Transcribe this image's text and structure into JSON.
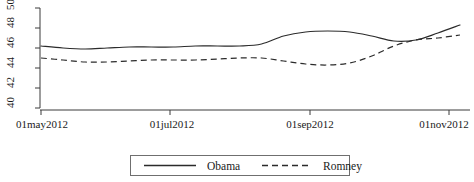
{
  "chart_data": {
    "type": "line",
    "title": "",
    "xlabel": "",
    "ylabel": "",
    "grid": false,
    "legend_position": "bottom-center",
    "ylim": [
      40,
      50
    ],
    "yticks": [
      40,
      42,
      44,
      46,
      48,
      50
    ],
    "ytick_labels": [
      "40",
      "42",
      "44",
      "46",
      "48",
      "50"
    ],
    "xticks": [
      "01may2012",
      "01jul2012",
      "01sep2012",
      "01nov2012"
    ],
    "xtick_labels": [
      "01may2012",
      "01jul2012",
      "01sep2012",
      "01nov2012"
    ],
    "xlim": [
      "01may2012",
      "01nov2012"
    ],
    "series": [
      {
        "name": "Obama",
        "style": "solid",
        "color": "#2b2b2b",
        "x": [
          "01may2012",
          "08may2012",
          "15may2012",
          "01jun2012",
          "15jun2012",
          "01jul2012",
          "15jul2012",
          "01aug2012",
          "15aug2012",
          "25aug2012",
          "01sep2012",
          "08sep2012",
          "15sep2012",
          "22sep2012",
          "29sep2012",
          "06oct2012",
          "13oct2012",
          "20oct2012",
          "27oct2012",
          "01nov2012"
        ],
        "values": [
          46.2,
          46.0,
          45.9,
          46.0,
          46.1,
          46.1,
          46.1,
          46.2,
          46.2,
          46.2,
          46.4,
          47.2,
          47.6,
          47.7,
          47.6,
          47.2,
          46.7,
          46.8,
          47.5,
          48.3
        ]
      },
      {
        "name": "Romney",
        "style": "dashed",
        "color": "#2b2b2b",
        "x": [
          "01may2012",
          "08may2012",
          "15may2012",
          "01jun2012",
          "15jun2012",
          "01jul2012",
          "15jul2012",
          "01aug2012",
          "15aug2012",
          "25aug2012",
          "01sep2012",
          "08sep2012",
          "15sep2012",
          "22sep2012",
          "29sep2012",
          "06oct2012",
          "13oct2012",
          "20oct2012",
          "27oct2012",
          "01nov2012"
        ],
        "values": [
          45.0,
          44.8,
          44.6,
          44.6,
          44.7,
          44.8,
          44.8,
          44.8,
          44.9,
          45.0,
          45.0,
          44.7,
          44.4,
          44.3,
          44.5,
          45.2,
          46.2,
          46.8,
          47.0,
          47.3
        ]
      }
    ]
  },
  "legend": {
    "items": [
      {
        "label": "Obama",
        "style": "solid"
      },
      {
        "label": "Romney",
        "style": "dashed"
      }
    ]
  },
  "axis": {
    "y_labels": [
      "40",
      "42",
      "44",
      "46",
      "48",
      "50"
    ],
    "x_labels": [
      "01may2012",
      "01jul2012",
      "01sep2012",
      "01nov2012"
    ]
  }
}
